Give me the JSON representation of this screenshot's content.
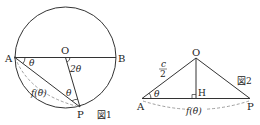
{
  "figure1": {
    "caption": "図1",
    "points": {
      "A": "A",
      "O": "O",
      "B": "B",
      "P": "P"
    },
    "angle_A": "θ",
    "angle_O": "2θ",
    "angle_P": "θ",
    "arc_label": "f(θ)"
  },
  "figure2": {
    "caption": "図2",
    "points": {
      "O": "O",
      "A": "A",
      "P": "P",
      "H": "H"
    },
    "side_label_num": "c",
    "side_label_den": "2",
    "angle_A": "θ",
    "arc_label": "f(θ)"
  },
  "colors": {
    "line": "#333333",
    "dashed": "#888888"
  }
}
